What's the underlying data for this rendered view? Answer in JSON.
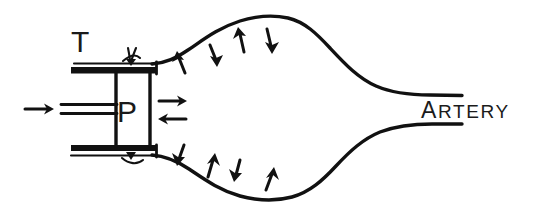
{
  "figure": {
    "background_color": "#ffffff",
    "ink_color": "#111111",
    "width": 535,
    "height": 216
  },
  "labels": {
    "transducer": "T",
    "probe": "P",
    "artery": "ARTERY",
    "artery_initial": "A",
    "artery_rest": "RTERY"
  },
  "annotations": {
    "inlet_arrow": "flow-in-arrow-right",
    "probe_arrow_right": "probe-arrow-right",
    "probe_arrow_left": "probe-arrow-left",
    "upper_wall_arrows": [
      {
        "name": "upper-arrow-up-1",
        "direction": "up"
      },
      {
        "name": "upper-arrow-down-1",
        "direction": "down"
      },
      {
        "name": "upper-arrow-up-2",
        "direction": "up"
      },
      {
        "name": "upper-arrow-down-2",
        "direction": "down"
      }
    ],
    "lower_wall_arrows": [
      {
        "name": "lower-arrow-down-1",
        "direction": "down"
      },
      {
        "name": "lower-arrow-up-1",
        "direction": "up"
      },
      {
        "name": "lower-arrow-down-2",
        "direction": "down"
      },
      {
        "name": "lower-arrow-up-2",
        "direction": "up"
      }
    ],
    "tick_marks": "small-tick-marks"
  },
  "parts": {
    "upper_plate": "upper-mounting-plate",
    "lower_plate": "lower-mounting-plate",
    "probe_body": "probe-body-box",
    "catheter_lines": "catheter-twin-lines",
    "upper_vessel_wall": "upper-artery-wall",
    "lower_vessel_wall": "lower-artery-wall"
  }
}
